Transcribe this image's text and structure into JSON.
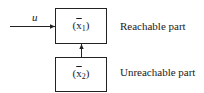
{
  "diagram": {
    "type": "block-diagram",
    "input": {
      "label": "u"
    },
    "blocks": [
      {
        "id": "reachable",
        "state_var": "x",
        "state_sub": "1",
        "description": "Reachable part"
      },
      {
        "id": "unreachable",
        "state_var": "x",
        "state_sub": "2",
        "description": "Unreachable part"
      }
    ],
    "connections": [
      {
        "from": "input",
        "to": "reachable"
      },
      {
        "from": "unreachable",
        "to": "reachable"
      }
    ],
    "colors": {
      "stroke": "#222222",
      "text": "#1a1a1a",
      "background": "#ffffff"
    }
  }
}
